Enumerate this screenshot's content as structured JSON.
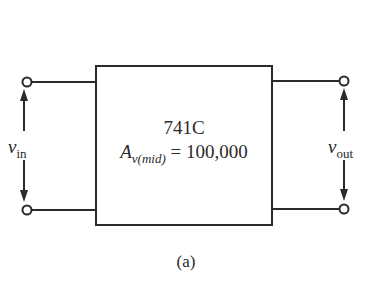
{
  "figure": {
    "caption": "(a)",
    "block": {
      "part_name": "741C",
      "gain_symbol": "A",
      "gain_subscript": "v(mid)",
      "gain_equals": " = ",
      "gain_value": "100,000"
    },
    "input": {
      "symbol": "v",
      "subscript": "in"
    },
    "output": {
      "symbol": "v",
      "subscript": "out"
    },
    "colors": {
      "line": "#2a2a2a",
      "background": "#ffffff"
    }
  }
}
